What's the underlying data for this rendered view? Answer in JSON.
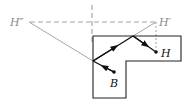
{
  "diagram": {
    "type": "reflection-path",
    "labels": {
      "h_double_prime": "H″",
      "h_prime": "H′",
      "h": "H",
      "b": "B"
    },
    "points": {
      "H_double_prime": [
        28,
        22
      ],
      "H_prime": [
        156,
        22
      ],
      "H": [
        156,
        52
      ],
      "B": [
        114,
        72
      ],
      "reflect_left": [
        93,
        61
      ],
      "reflect_top": [
        133,
        36
      ]
    },
    "shape": {
      "kind": "L-shaped region",
      "vertices": [
        [
          93,
          36
        ],
        [
          181,
          36
        ],
        [
          181,
          61
        ],
        [
          126,
          61
        ],
        [
          126,
          98
        ],
        [
          93,
          98
        ]
      ]
    },
    "colors": {
      "outline": "#222222",
      "path": "#111111",
      "construction": "#9a9a9a",
      "label_primary": "#111111",
      "label_secondary": "#8a8a8a"
    }
  }
}
